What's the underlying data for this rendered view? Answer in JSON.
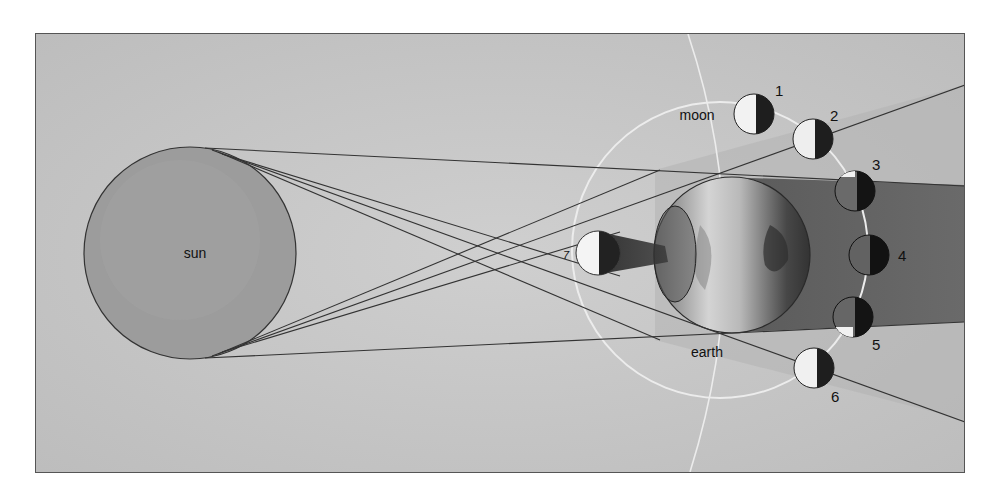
{
  "diagram": {
    "colors": {
      "page": "#ffffff",
      "frame_bg": "#c9c9c9",
      "frame_border": "#555555",
      "sun_fill": "#9a9a9a",
      "earth_light": "#d6d6d6",
      "earth_dark": "#4a4a4a",
      "umbra": "#6e6e6e",
      "penumbra": "#a6a6a6",
      "orbit": "#eeeeee",
      "line": "#3a3a3a",
      "moon_light": "#f4f4f4",
      "moon_dark": "#1e1e1e"
    },
    "labels": {
      "sun": "sun",
      "earth": "earth",
      "moon": "moon"
    },
    "moons": [
      {
        "id": "1",
        "label": "1"
      },
      {
        "id": "2",
        "label": "2"
      },
      {
        "id": "3",
        "label": "3"
      },
      {
        "id": "4",
        "label": "4"
      },
      {
        "id": "5",
        "label": "5"
      },
      {
        "id": "6",
        "label": "6"
      },
      {
        "id": "7",
        "label": "7"
      }
    ]
  }
}
